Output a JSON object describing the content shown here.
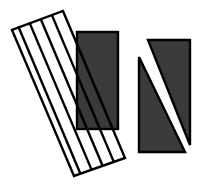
{
  "figure": {
    "title": "abstract-geometric-figure",
    "canvas": {
      "width": 203,
      "height": 186,
      "background": "#ffffff"
    },
    "palette": {
      "dark_fill": "#3a3a3a",
      "stroke": "#000000",
      "light_fill": "#ffffff",
      "background": "#ffffff"
    },
    "shapes": [
      {
        "id": "striped-parallelogram",
        "label": "Striped tilted rectangle",
        "kind": "parallelogram",
        "fill": "#ffffff",
        "stroke": "#000000",
        "stroke_width": 2,
        "stripe_count": 5,
        "stripe_orientation": "diagonal",
        "corners": [
          {
            "x": 63,
            "y": 11
          },
          {
            "x": 125,
            "y": 158
          },
          {
            "x": 74,
            "y": 176
          },
          {
            "x": 12,
            "y": 30
          }
        ],
        "stripe_lines": [
          {
            "x1": 51.8,
            "y1": 14.9,
            "x2": 113.8,
            "y2": 161.9
          },
          {
            "x1": 40.6,
            "y1": 18.7,
            "x2": 102.6,
            "y2": 165.7
          },
          {
            "x1": 29.4,
            "y1": 22.4,
            "x2": 91.4,
            "y2": 169.4
          },
          {
            "x1": 18.2,
            "y1": 26.2,
            "x2": 80.2,
            "y2": 173.2
          }
        ]
      },
      {
        "id": "dark-rectangle",
        "label": "Solid dark rectangle",
        "kind": "rectangle",
        "fill": "#3a3a3a",
        "stroke": "#000000",
        "stroke_width": 2,
        "x": 77,
        "y": 32,
        "width": 41,
        "height": 97
      },
      {
        "id": "split-rectangle",
        "label": "Dark rectangle split by white diagonal band",
        "kind": "rectangle-with-diagonal-band",
        "fill": "#3a3a3a",
        "stroke": "#000000",
        "stroke_width": 2,
        "x": 139,
        "y": 40,
        "width": 51,
        "height": 112,
        "band_fill": "#ffffff",
        "triangle_lower_left": [
          {
            "x": 139,
            "y": 57
          },
          {
            "x": 139,
            "y": 152
          },
          {
            "x": 185,
            "y": 152
          }
        ],
        "triangle_upper_right": [
          {
            "x": 148,
            "y": 40
          },
          {
            "x": 190,
            "y": 40
          },
          {
            "x": 190,
            "y": 145
          }
        ]
      }
    ]
  }
}
